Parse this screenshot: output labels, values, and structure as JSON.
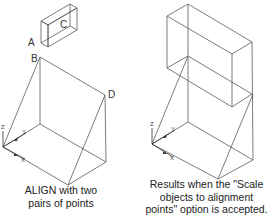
{
  "figure": {
    "left_panel": {
      "point_labels": {
        "a": "A",
        "b": "B",
        "c": "C",
        "d": "D"
      },
      "caption": [
        "ALIGN with two",
        "pairs of points"
      ]
    },
    "right_panel": {
      "caption": [
        "Results when the \"Scale",
        "objects to alignment",
        "points\" option is accepted."
      ]
    },
    "ucs_icon": {
      "z": "Z",
      "y": "Y",
      "x": "X"
    },
    "colors": {
      "line": "#5a5a5a",
      "text": "#222222",
      "background": "#ffffff"
    }
  }
}
